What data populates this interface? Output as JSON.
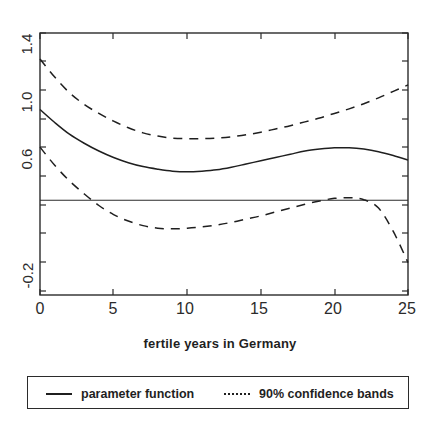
{
  "figure": {
    "background": "#ffffff",
    "ink_color": "#1f1f1f",
    "plot_frame": {
      "left": 40,
      "top": 33,
      "right": 408,
      "bottom": 295
    }
  },
  "axis": {
    "x_title": "fertile years in Germany",
    "x_ticks": [
      "0",
      "5",
      "10",
      "15",
      "20",
      "25"
    ],
    "y_ticks": [
      "1.4",
      "1.0",
      "0.6",
      "-0.2"
    ]
  },
  "legend": {
    "items": [
      {
        "label": "parameter function",
        "style": "solid",
        "marker": "solid-line"
      },
      {
        "label": "90% confidence bands",
        "style": "dashed",
        "marker": "dotted-line"
      }
    ]
  },
  "chart_data": {
    "type": "line",
    "title": "",
    "subtitle": "",
    "xlabel": "fertile years in Germany",
    "ylabel": "",
    "xlim": [
      0,
      25
    ],
    "ylim": [
      -0.62,
      1.4
    ],
    "xticks": [
      0,
      5,
      10,
      15,
      20,
      25
    ],
    "yticks": [
      1.4,
      1.0,
      0.6,
      -0.2
    ],
    "grid": false,
    "legend_position": "below-axes",
    "annotations": [
      "horizontal reference line at y = 0.11"
    ],
    "reference_lines": [
      {
        "orientation": "horizontal",
        "y": 0.11
      }
    ],
    "x": [
      0,
      1,
      2,
      3,
      4,
      5,
      6,
      7,
      8,
      9,
      10,
      11,
      12,
      13,
      14,
      15,
      16,
      17,
      18,
      19,
      20,
      21,
      22,
      23,
      24,
      25
    ],
    "series": [
      {
        "name": "parameter function",
        "style": "solid",
        "values": [
          0.81,
          0.71,
          0.62,
          0.55,
          0.49,
          0.44,
          0.4,
          0.37,
          0.35,
          0.335,
          0.33,
          0.335,
          0.345,
          0.365,
          0.39,
          0.415,
          0.44,
          0.465,
          0.49,
          0.505,
          0.515,
          0.515,
          0.505,
          0.485,
          0.455,
          0.42
        ]
      },
      {
        "name": "90% confidence band upper",
        "style": "dashed",
        "values": [
          1.2,
          1.06,
          0.94,
          0.85,
          0.78,
          0.72,
          0.67,
          0.63,
          0.605,
          0.59,
          0.585,
          0.585,
          0.59,
          0.6,
          0.615,
          0.635,
          0.66,
          0.685,
          0.715,
          0.745,
          0.78,
          0.815,
          0.855,
          0.9,
          0.95,
          1.0
        ]
      },
      {
        "name": "90% confidence band lower",
        "style": "dashed",
        "values": [
          0.52,
          0.38,
          0.26,
          0.16,
          0.07,
          0.0,
          -0.05,
          -0.085,
          -0.105,
          -0.11,
          -0.105,
          -0.095,
          -0.08,
          -0.06,
          -0.035,
          -0.01,
          0.02,
          0.05,
          0.08,
          0.105,
          0.125,
          0.13,
          0.115,
          0.05,
          -0.13,
          -0.37
        ]
      }
    ]
  }
}
